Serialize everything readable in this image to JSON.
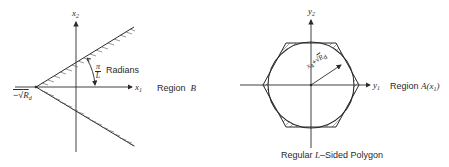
{
  "left_diagram": {
    "axes": {
      "horizontal_label": "x",
      "horizontal_sub": "1",
      "vertical_label": "x",
      "vertical_sub": "2"
    },
    "apex_label_prefix": "−√",
    "apex_label_var": "R",
    "apex_label_sub": "d",
    "angle_label": {
      "numerator": "π",
      "denominator": "L",
      "unit": "Radians"
    },
    "region_label": "Region",
    "region_name": "B"
  },
  "right_diagram": {
    "axes": {
      "horizontal_label": "y",
      "horizontal_sub": "1",
      "vertical_label": "y",
      "vertical_sub": "2"
    },
    "radius_label": {
      "var1": "x",
      "var1_sub": "4",
      "op": "+",
      "sqrt": "√",
      "var2": "R",
      "var2_sub": "d"
    },
    "region_label": "Region",
    "region_name": "A(x",
    "region_name_sub": "1",
    "region_name_close": ")",
    "caption_prefix": "Regular",
    "caption_var": "L",
    "caption_suffix": "–Sided Polygon"
  },
  "colors": {
    "ink": "#2a2a2a",
    "background": "#ffffff"
  }
}
